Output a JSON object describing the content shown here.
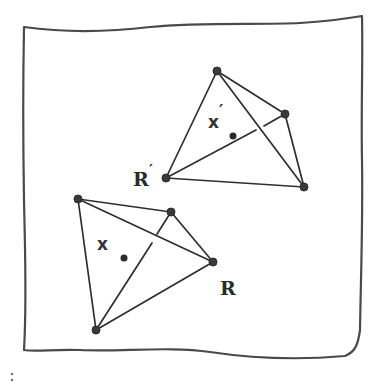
{
  "diagram": {
    "frame": {
      "color": "#4a4a4a"
    },
    "upper_tetrahedron": {
      "name": "transformed",
      "vertices": [
        [
          217,
          71
        ],
        [
          285,
          114
        ],
        [
          304,
          187
        ],
        [
          166,
          178
        ]
      ],
      "vertex_label": "R′",
      "point_label": "x′",
      "center_dot": [
        233,
        135
      ]
    },
    "lower_tetrahedron": {
      "name": "original",
      "vertices": [
        [
          78,
          199
        ],
        [
          171,
          212
        ],
        [
          213,
          262
        ],
        [
          96,
          330
        ]
      ],
      "vertex_label": "R",
      "point_label": "x",
      "center_dot": [
        124,
        258
      ]
    },
    "ink_color": "#2e2e2e"
  },
  "labels": {
    "r_prime": "R",
    "r_prime_mark": "′",
    "r": "R",
    "x_prime": "x",
    "x_prime_mark": "′",
    "x": "x"
  }
}
